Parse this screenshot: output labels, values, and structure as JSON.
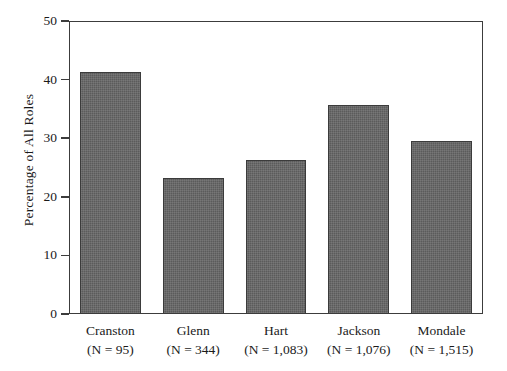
{
  "chart_data": {
    "type": "bar",
    "title": "",
    "subtitle": "",
    "xlabel": "",
    "ylabel": "Percentage of All Roles",
    "categories": [
      "Cranston",
      "Glenn",
      "Hart",
      "Jackson",
      "Mondale"
    ],
    "category_sublabels": [
      "(N  =  95)",
      "(N  =  344)",
      "(N  =  1,083)",
      "(N  =  1,076)",
      "(N  =  1,515)"
    ],
    "n_values": [
      95,
      344,
      1083,
      1076,
      1515
    ],
    "values": [
      41.3,
      23.2,
      26.2,
      35.6,
      29.5
    ],
    "ylim": [
      0,
      50
    ],
    "yticks": [
      0,
      10,
      20,
      30,
      40,
      50
    ],
    "ytick_labels": [
      "0",
      "10",
      "20",
      "30",
      "40",
      "50"
    ],
    "grid": false,
    "legend": null,
    "bar_color": "#5b5b5b",
    "bar_edge_color": "#3b3b3b",
    "axis_color": "#3c3c3c",
    "background_color": "#ffffff"
  }
}
